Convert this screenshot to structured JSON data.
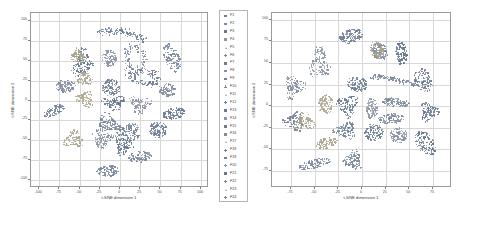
{
  "figure": {
    "panels": [
      {
        "id": "left",
        "name": "tsne-plot-left",
        "xlabel": "t-SNE dimension 1",
        "ylabel": "t-SNE dimension 2",
        "xticks": [
          -100,
          -75,
          -50,
          -25,
          0,
          25,
          50,
          75,
          100
        ],
        "yticks": [
          100,
          75,
          50,
          25,
          0,
          -25,
          -50,
          -75,
          -100
        ],
        "xlim": [
          -110,
          110
        ],
        "ylim": [
          -110,
          110
        ],
        "grid": true
      },
      {
        "id": "right",
        "name": "tsne-plot-right",
        "xlabel": "t-SNE dimension 1",
        "ylabel": "t-SNE dimension 2",
        "xticks": [
          -75,
          -50,
          -25,
          0,
          25,
          50,
          75
        ],
        "yticks": [
          100,
          75,
          50,
          25,
          0,
          -25,
          -50,
          -75
        ],
        "xlim": [
          -95,
          95
        ],
        "ylim": [
          -95,
          108
        ],
        "grid": true
      }
    ],
    "legend": {
      "name": "class-legend",
      "position": "between-panels",
      "entries": [
        {
          "label": "F1",
          "marker": "square",
          "color": "#6f7f96"
        },
        {
          "label": "F2",
          "marker": "square",
          "color": "#7b8aa0"
        },
        {
          "label": "F3",
          "marker": "square",
          "color": "#65788f"
        },
        {
          "label": "F4",
          "marker": "square",
          "color": "#8b95a6"
        },
        {
          "label": "F5",
          "marker": "triangle",
          "color": "#a9a48c"
        },
        {
          "label": "F6",
          "marker": "plus",
          "color": "#7a8699"
        },
        {
          "label": "F7",
          "marker": "square",
          "color": "#6d7d93"
        },
        {
          "label": "F8",
          "marker": "square",
          "color": "#84909f"
        },
        {
          "label": "F9",
          "marker": "square",
          "color": "#707f94"
        },
        {
          "label": "F10",
          "marker": "plus",
          "color": "#7f8b9d"
        },
        {
          "label": "F11",
          "marker": "triangle",
          "color": "#b0ab93"
        },
        {
          "label": "F12",
          "marker": "plus",
          "color": "#76849a"
        },
        {
          "label": "F13",
          "marker": "square",
          "color": "#69798f"
        },
        {
          "label": "F14",
          "marker": "square",
          "color": "#8d96a5"
        },
        {
          "label": "F15",
          "marker": "square",
          "color": "#6b7b92"
        },
        {
          "label": "F16",
          "marker": "square",
          "color": "#7d8a9e"
        },
        {
          "label": "F17",
          "marker": "triangle",
          "color": "#aaa68e"
        },
        {
          "label": "F18",
          "marker": "plus",
          "color": "#74839a"
        },
        {
          "label": "F19",
          "marker": "square",
          "color": "#6e7e95"
        },
        {
          "label": "F20",
          "marker": "plus",
          "color": "#8893a3"
        },
        {
          "label": "F21",
          "marker": "square",
          "color": "#67798f"
        },
        {
          "label": "F22",
          "marker": "plus",
          "color": "#7b899d"
        },
        {
          "label": "F23",
          "marker": "triangle",
          "color": "#aca791"
        },
        {
          "label": "F24",
          "marker": "plus",
          "color": "#79879b"
        }
      ]
    }
  },
  "chart_data": [
    {
      "type": "scatter",
      "id": "left",
      "title": "",
      "xlabel": "t-SNE dimension 1",
      "ylabel": "t-SNE dimension 2",
      "xlim": [
        -110,
        110
      ],
      "ylim": [
        -110,
        110
      ],
      "xticks": [
        -100,
        -75,
        -50,
        -25,
        0,
        25,
        50,
        75,
        100
      ],
      "yticks": [
        -100,
        -75,
        -50,
        -25,
        0,
        25,
        50,
        75,
        100
      ],
      "grid": true,
      "legend_position": "right",
      "note": "classes overlap and merge; elongated stringy clusters near centre",
      "series": [
        {
          "name": "F1",
          "color": "#6f7f96",
          "marker": "square",
          "cx": 2,
          "cy": 84,
          "rx": 30,
          "ry": 5,
          "angle": -8,
          "n": 120,
          "shape": "arc"
        },
        {
          "name": "F2",
          "color": "#7b8aa0",
          "marker": "square",
          "cx": 64,
          "cy": 54,
          "rx": 9,
          "ry": 19,
          "angle": 22,
          "n": 120,
          "shape": "blob"
        },
        {
          "name": "F3",
          "color": "#65788f",
          "marker": "square",
          "cx": -47,
          "cy": 47,
          "rx": 11,
          "ry": 17,
          "angle": -15,
          "n": 130,
          "shape": "rough"
        },
        {
          "name": "F4",
          "color": "#8b95a6",
          "marker": "square",
          "cx": -14,
          "cy": 54,
          "rx": 9,
          "ry": 11,
          "angle": 0,
          "n": 100,
          "shape": "blob"
        },
        {
          "name": "F5",
          "color": "#a9a48c",
          "marker": "triangle",
          "cx": -53,
          "cy": 56,
          "rx": 10,
          "ry": 9,
          "angle": 10,
          "n": 90,
          "shape": "rough"
        },
        {
          "name": "F6",
          "color": "#7a8699",
          "marker": "plus",
          "cx": 18,
          "cy": 52,
          "rx": 14,
          "ry": 20,
          "angle": 0,
          "n": 110,
          "shape": "ring"
        },
        {
          "name": "F7",
          "color": "#6d7d93",
          "marker": "square",
          "cx": 30,
          "cy": 30,
          "rx": 18,
          "ry": 10,
          "angle": -12,
          "n": 110,
          "shape": "ring"
        },
        {
          "name": "F8",
          "color": "#84909f",
          "marker": "square",
          "cx": -68,
          "cy": 19,
          "rx": 12,
          "ry": 8,
          "angle": 5,
          "n": 110,
          "shape": "blob"
        },
        {
          "name": "F9",
          "color": "#707f94",
          "marker": "square",
          "cx": -12,
          "cy": 17,
          "rx": 11,
          "ry": 11,
          "angle": 0,
          "n": 120,
          "shape": "blob"
        },
        {
          "name": "F10",
          "color": "#7f8b9d",
          "marker": "plus",
          "cx": 58,
          "cy": 13,
          "rx": 10,
          "ry": 9,
          "angle": 0,
          "n": 100,
          "shape": "blob"
        },
        {
          "name": "F11",
          "color": "#b0ab93",
          "marker": "triangle",
          "cx": -44,
          "cy": 2,
          "rx": 11,
          "ry": 9,
          "angle": -20,
          "n": 100,
          "shape": "rough"
        },
        {
          "name": "F12",
          "color": "#76849a",
          "marker": "plus",
          "cx": -82,
          "cy": -12,
          "rx": 14,
          "ry": 6,
          "angle": 28,
          "n": 100,
          "shape": "blob"
        },
        {
          "name": "F13",
          "color": "#69798f",
          "marker": "square",
          "cx": -8,
          "cy": -2,
          "rx": 13,
          "ry": 8,
          "angle": 0,
          "n": 110,
          "shape": "rough"
        },
        {
          "name": "F14",
          "color": "#8d96a5",
          "marker": "square",
          "cx": 24,
          "cy": -4,
          "rx": 12,
          "ry": 10,
          "angle": 0,
          "n": 110,
          "shape": "rough"
        },
        {
          "name": "F15",
          "color": "#6b7b92",
          "marker": "square",
          "cx": 66,
          "cy": -16,
          "rx": 14,
          "ry": 7,
          "angle": 12,
          "n": 110,
          "shape": "blob"
        },
        {
          "name": "F16",
          "color": "#7d8a9e",
          "marker": "square",
          "cx": -16,
          "cy": -28,
          "rx": 14,
          "ry": 11,
          "angle": 0,
          "n": 130,
          "shape": "rough"
        },
        {
          "name": "F17",
          "color": "#aaa68e",
          "marker": "triangle",
          "cx": -58,
          "cy": -48,
          "rx": 11,
          "ry": 10,
          "angle": 0,
          "n": 100,
          "shape": "rough"
        },
        {
          "name": "F18",
          "color": "#74839a",
          "marker": "plus",
          "cx": 9,
          "cy": -38,
          "rx": 16,
          "ry": 9,
          "angle": -6,
          "n": 130,
          "shape": "rough"
        },
        {
          "name": "F19",
          "color": "#6e7e95",
          "marker": "square",
          "cx": 46,
          "cy": -36,
          "rx": 11,
          "ry": 10,
          "angle": 0,
          "n": 110,
          "shape": "blob"
        },
        {
          "name": "F20",
          "color": "#8893a3",
          "marker": "plus",
          "cx": -22,
          "cy": -48,
          "rx": 13,
          "ry": 9,
          "angle": 0,
          "n": 110,
          "shape": "rough"
        },
        {
          "name": "F21",
          "color": "#67798f",
          "marker": "square",
          "cx": 4,
          "cy": -55,
          "rx": 11,
          "ry": 11,
          "angle": 0,
          "n": 120,
          "shape": "rough"
        },
        {
          "name": "F22",
          "color": "#7b899d",
          "marker": "plus",
          "cx": 24,
          "cy": -70,
          "rx": 15,
          "ry": 7,
          "angle": 8,
          "n": 110,
          "shape": "blob"
        },
        {
          "name": "F23",
          "color": "#aca791",
          "marker": "triangle",
          "cx": -44,
          "cy": 28,
          "rx": 9,
          "ry": 8,
          "angle": 0,
          "n": 80,
          "shape": "rough"
        },
        {
          "name": "F24",
          "color": "#79879b",
          "marker": "plus",
          "cx": -16,
          "cy": -88,
          "rx": 14,
          "ry": 7,
          "angle": 6,
          "n": 110,
          "shape": "blob"
        }
      ]
    },
    {
      "type": "scatter",
      "id": "right",
      "title": "",
      "xlabel": "t-SNE dimension 1",
      "ylabel": "t-SNE dimension 2",
      "xlim": [
        -95,
        95
      ],
      "ylim": [
        -95,
        108
      ],
      "xticks": [
        -75,
        -50,
        -25,
        0,
        25,
        50,
        75
      ],
      "yticks": [
        -75,
        -50,
        -25,
        0,
        25,
        50,
        75,
        100
      ],
      "grid": true,
      "legend_position": "none",
      "note": "classes are compact and well separated",
      "series": [
        {
          "name": "F1",
          "color": "#6f7f96",
          "marker": "square",
          "cx": -12,
          "cy": 82,
          "rx": 13,
          "ry": 8,
          "angle": 18,
          "n": 120,
          "shape": "blob"
        },
        {
          "name": "F2",
          "color": "#7b8aa0",
          "marker": "square",
          "cx": 18,
          "cy": 64,
          "rx": 8,
          "ry": 11,
          "angle": 15,
          "n": 110,
          "shape": "blob"
        },
        {
          "name": "F3",
          "color": "#65788f",
          "marker": "square",
          "cx": 41,
          "cy": 62,
          "rx": 6,
          "ry": 14,
          "angle": 5,
          "n": 110,
          "shape": "blob"
        },
        {
          "name": "F4",
          "color": "#8b95a6",
          "marker": "square",
          "cx": -45,
          "cy": 50,
          "rx": 10,
          "ry": 17,
          "angle": 0,
          "n": 140,
          "shape": "rough"
        },
        {
          "name": "F5",
          "color": "#a9a48c",
          "marker": "triangle",
          "cx": 15,
          "cy": 66,
          "rx": 7,
          "ry": 10,
          "angle": 12,
          "n": 95,
          "shape": "blob"
        },
        {
          "name": "F6",
          "color": "#7a8699",
          "marker": "plus",
          "cx": 33,
          "cy": 31,
          "rx": 24,
          "ry": 3,
          "angle": -10,
          "n": 110,
          "shape": "arc"
        },
        {
          "name": "F7",
          "color": "#6d7d93",
          "marker": "square",
          "cx": 64,
          "cy": 31,
          "rx": 9,
          "ry": 14,
          "angle": 18,
          "n": 125,
          "shape": "blob"
        },
        {
          "name": "F8",
          "color": "#84909f",
          "marker": "square",
          "cx": -72,
          "cy": 23,
          "rx": 10,
          "ry": 12,
          "angle": -10,
          "n": 120,
          "shape": "rough"
        },
        {
          "name": "F9",
          "color": "#707f94",
          "marker": "square",
          "cx": -6,
          "cy": 26,
          "rx": 11,
          "ry": 9,
          "angle": 0,
          "n": 120,
          "shape": "blob"
        },
        {
          "name": "F10",
          "color": "#7f8b9d",
          "marker": "plus",
          "cx": 35,
          "cy": 5,
          "rx": 15,
          "ry": 5,
          "angle": -8,
          "n": 110,
          "shape": "blob"
        },
        {
          "name": "F11",
          "color": "#b0ab93",
          "marker": "triangle",
          "cx": -39,
          "cy": 3,
          "rx": 8,
          "ry": 11,
          "angle": 0,
          "n": 100,
          "shape": "blob"
        },
        {
          "name": "F12",
          "color": "#76849a",
          "marker": "plus",
          "cx": -72,
          "cy": -17,
          "rx": 10,
          "ry": 10,
          "angle": 0,
          "n": 110,
          "shape": "rough"
        },
        {
          "name": "F13",
          "color": "#69798f",
          "marker": "square",
          "cx": -16,
          "cy": 1,
          "rx": 10,
          "ry": 12,
          "angle": 0,
          "n": 125,
          "shape": "rough"
        },
        {
          "name": "F14",
          "color": "#8d96a5",
          "marker": "square",
          "cx": 10,
          "cy": -2,
          "rx": 6,
          "ry": 12,
          "angle": 0,
          "n": 110,
          "shape": "blob"
        },
        {
          "name": "F15",
          "color": "#6b7b92",
          "marker": "square",
          "cx": 70,
          "cy": -6,
          "rx": 9,
          "ry": 10,
          "angle": 0,
          "n": 115,
          "shape": "rough"
        },
        {
          "name": "F16",
          "color": "#7d8a9e",
          "marker": "square",
          "cx": 30,
          "cy": -14,
          "rx": 14,
          "ry": 6,
          "angle": 6,
          "n": 115,
          "shape": "blob"
        },
        {
          "name": "F17",
          "color": "#aaa68e",
          "marker": "triangle",
          "cx": -38,
          "cy": -42,
          "rx": 12,
          "ry": 6,
          "angle": 22,
          "n": 100,
          "shape": "blob"
        },
        {
          "name": "F18",
          "color": "#74839a",
          "marker": "plus",
          "cx": -18,
          "cy": -28,
          "rx": 11,
          "ry": 9,
          "angle": 0,
          "n": 120,
          "shape": "rough"
        },
        {
          "name": "F19",
          "color": "#6e7e95",
          "marker": "square",
          "cx": 12,
          "cy": -30,
          "rx": 10,
          "ry": 10,
          "angle": 0,
          "n": 120,
          "shape": "blob"
        },
        {
          "name": "F20",
          "color": "#8893a3",
          "marker": "plus",
          "cx": 38,
          "cy": -33,
          "rx": 9,
          "ry": 9,
          "angle": 0,
          "n": 110,
          "shape": "blob"
        },
        {
          "name": "F21",
          "color": "#67798f",
          "marker": "square",
          "cx": 66,
          "cy": -42,
          "rx": 9,
          "ry": 16,
          "angle": 32,
          "n": 125,
          "shape": "blob"
        },
        {
          "name": "F22",
          "color": "#7b899d",
          "marker": "plus",
          "cx": -50,
          "cy": -66,
          "rx": 18,
          "ry": 5,
          "angle": 16,
          "n": 120,
          "shape": "blob"
        },
        {
          "name": "F23",
          "color": "#aca791",
          "marker": "triangle",
          "cx": -61,
          "cy": -18,
          "rx": 10,
          "ry": 9,
          "angle": 0,
          "n": 105,
          "shape": "rough"
        },
        {
          "name": "F24",
          "color": "#79879b",
          "marker": "plus",
          "cx": -10,
          "cy": -62,
          "rx": 9,
          "ry": 10,
          "angle": 0,
          "n": 115,
          "shape": "rough"
        }
      ]
    }
  ]
}
